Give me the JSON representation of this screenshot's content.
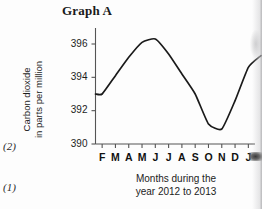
{
  "title": "Graph A",
  "margin_labels": {
    "upper": "(2)",
    "lower": "(1)"
  },
  "chart_data": {
    "type": "line",
    "title": "Graph A",
    "xlabel": "Months during the year 2012 to 2013",
    "xlabel_line1": "Months during the",
    "xlabel_line2": "year 2012 to 2013",
    "ylabel": "Carbon dioxide in parts per million",
    "ylabel_line1": "Carbon dioxide",
    "ylabel_line2": "in parts per million",
    "categories": [
      "F",
      "M",
      "A",
      "M",
      "J",
      "J",
      "A",
      "S",
      "O",
      "N",
      "D",
      "J"
    ],
    "x_tick_labels": [
      "F",
      "M",
      "A",
      "M",
      "J",
      "J",
      "A",
      "S",
      "O",
      "N",
      "D",
      "J"
    ],
    "y_tick_labels": [
      "390",
      "392",
      "394",
      "396"
    ],
    "y_ticks": [
      390,
      392,
      394,
      396
    ],
    "ylim": [
      390,
      397
    ],
    "xlim": [
      0,
      12
    ],
    "grid": false,
    "legend": false,
    "series": [
      {
        "name": "Carbon dioxide",
        "values": [
          393.0,
          394.1,
          395.2,
          396.1,
          396.3,
          395.4,
          394.2,
          393.0,
          391.2,
          390.9,
          392.6,
          394.6
        ]
      }
    ],
    "annotations": {
      "peak_month": "M",
      "peak_value": 396.3,
      "trough_month": "O",
      "trough_value": 390.9,
      "start_value": 393.0,
      "end_value": 395.3
    },
    "line_color": "#1a1a1a",
    "axis_color": "#555555"
  }
}
